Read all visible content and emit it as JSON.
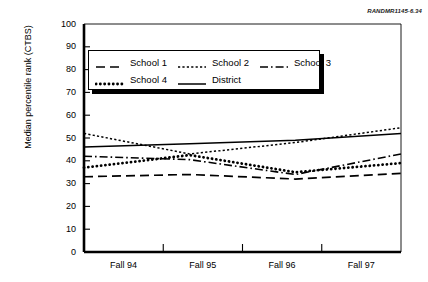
{
  "figure": {
    "source_label": "RANDMR1145-6.34"
  },
  "axes": {
    "ylabel": "Median percentile rank (CTBS)",
    "yticks": [
      "0",
      "10",
      "20",
      "30",
      "40",
      "50",
      "60",
      "70",
      "80",
      "90",
      "100"
    ],
    "xticks": [
      "Fall 94",
      "Fall 95",
      "Fall 96",
      "Fall 97"
    ]
  },
  "legend": {
    "rows": [
      [
        {
          "label": "School 1",
          "style": "long-dash"
        },
        {
          "label": "School 2",
          "style": "fine-dot"
        },
        {
          "label": "School 3",
          "style": "dash-dot"
        }
      ],
      [
        {
          "label": "School 4",
          "style": "thick-dot"
        },
        {
          "label": "District",
          "style": "solid"
        }
      ]
    ]
  },
  "chart_data": {
    "type": "line",
    "title": "",
    "xlabel": "",
    "ylabel": "Median percentile rank (CTBS)",
    "categories": [
      "Fall 94",
      "Fall 95",
      "Fall 96",
      "Fall 97"
    ],
    "ylim": [
      0,
      100
    ],
    "ytick_step": 10,
    "grid": false,
    "legend_position": "upper-left-inside",
    "series": [
      {
        "name": "School 1",
        "style": "long-dash",
        "color": "#000000",
        "values": [
          33,
          34,
          32,
          34.5
        ]
      },
      {
        "name": "School 2",
        "style": "fine-dot",
        "color": "#000000",
        "values": [
          52,
          43,
          48,
          54.5
        ]
      },
      {
        "name": "School 3",
        "style": "dash-dot",
        "color": "#000000",
        "values": [
          42,
          40.5,
          34,
          43
        ]
      },
      {
        "name": "School 4",
        "style": "thick-dot",
        "color": "#000000",
        "values": [
          37,
          42.5,
          35,
          39
        ]
      },
      {
        "name": "District",
        "style": "solid",
        "color": "#000000",
        "values": [
          46,
          47.5,
          49,
          52
        ]
      }
    ]
  }
}
